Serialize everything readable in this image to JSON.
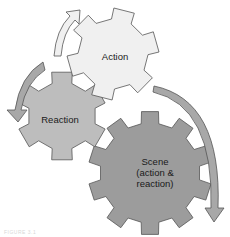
{
  "diagram": {
    "type": "gear-cycle",
    "nodes": [
      {
        "id": "action",
        "label": "Action",
        "fill": "#f0f0f0"
      },
      {
        "id": "reaction",
        "label": "Reaction",
        "fill": "#bdbdbd"
      },
      {
        "id": "scene",
        "label_line1": "Scene",
        "label_line2": "(action &",
        "label_line3": "reaction)",
        "fill": "#9c9c9c"
      }
    ],
    "arrows": [
      {
        "from": "reaction",
        "to": "action",
        "fill": "#f0f0f0"
      },
      {
        "from": "action",
        "to": "reaction",
        "fill": "#a8a8a8"
      },
      {
        "from": "action",
        "to": "scene",
        "fill": "#a8a8a8"
      }
    ],
    "stroke": "#555555"
  },
  "caption": "FIGURE 3.1"
}
